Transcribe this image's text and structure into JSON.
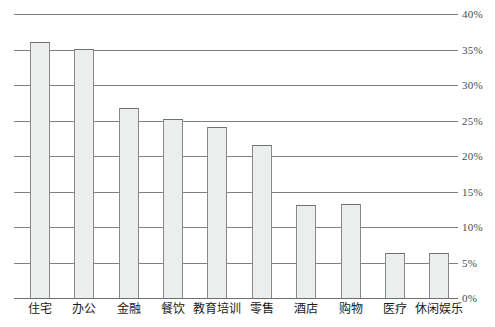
{
  "chart_data": {
    "type": "bar",
    "title": "",
    "xlabel": "",
    "ylabel": "",
    "categories": [
      "住宅",
      "办公",
      "金融",
      "餐饮",
      "教育培训",
      "零售",
      "酒店",
      "购物",
      "医疗",
      "休闲娱乐"
    ],
    "values": [
      36.1,
      35.1,
      26.8,
      25.2,
      24.1,
      21.5,
      13.1,
      13.2,
      6.4,
      6.3
    ],
    "ylim": [
      0,
      40
    ],
    "ytick_labels": [
      "40%",
      "35%",
      "30%",
      "25%",
      "20%",
      "15%",
      "10%",
      "5%",
      "0%"
    ],
    "ytick_values": [
      40,
      35,
      30,
      25,
      20,
      15,
      10,
      5,
      0
    ],
    "grid": true,
    "legend": "none",
    "axis_position": "right",
    "series": [
      {
        "name": "",
        "values": [
          36.1,
          35.1,
          26.8,
          25.2,
          24.1,
          21.5,
          13.1,
          13.2,
          6.4,
          6.3
        ]
      }
    ],
    "colors": {
      "bar_fill": "#eceded",
      "bar_border": "#888a8a",
      "gridline": "#808080",
      "text": "#1a1a1a",
      "tick_text": "#4a4a4a"
    }
  }
}
